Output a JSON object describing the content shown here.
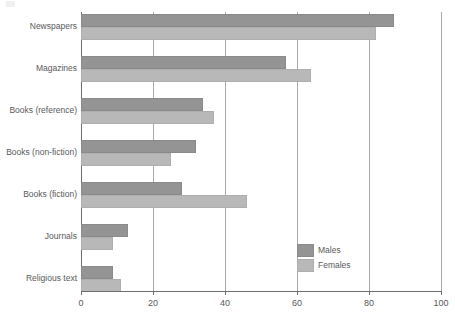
{
  "chart_data": {
    "type": "bar",
    "orientation": "horizontal",
    "title": "",
    "subtitle": "",
    "xlabel": "",
    "ylabel": "",
    "xlim": [
      0,
      100
    ],
    "xticks": [
      "0",
      "20",
      "40",
      "60",
      "80",
      "100"
    ],
    "xtick_values": [
      0,
      20,
      40,
      60,
      80,
      100
    ],
    "grid": "vertical gridlines at each x tick",
    "legend_position": "bottom-right inside plot area",
    "categories": [
      "Newspapers",
      "Magazines",
      "Books (reference)",
      "Books (non-fiction)",
      "Books (fiction)",
      "Journals",
      "Religious text"
    ],
    "series": [
      {
        "name": "Males",
        "color": "#949494",
        "values": [
          87,
          57,
          34,
          32,
          28,
          13,
          9
        ]
      },
      {
        "name": "Females",
        "color": "#b8b8b8",
        "values": [
          82,
          64,
          37,
          25,
          46,
          9,
          11
        ]
      }
    ]
  },
  "legend": {
    "items": [
      {
        "label": "Males",
        "color": "#949494"
      },
      {
        "label": "Females",
        "color": "#b8b8b8"
      }
    ]
  },
  "colors": {
    "males": "#949494",
    "females": "#b8b8b8",
    "axis": "#6d6e71",
    "gridline": "#a7a9ac",
    "text": "#58595b",
    "background": "#ffffff"
  }
}
